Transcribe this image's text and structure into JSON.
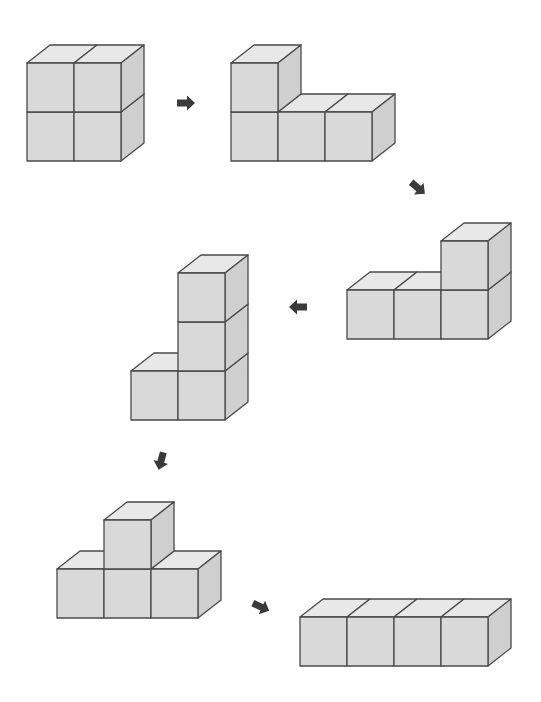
{
  "diagram": {
    "title": "Cube block transformation sequence",
    "cube": {
      "w": 47,
      "h": 49,
      "dx": 23,
      "dy": -18
    },
    "colors": {
      "background": "#ffffff",
      "front": "#d9d9d9",
      "top": "#e8e8e8",
      "side": "#cfcfcf",
      "stroke": "#4a4a4a",
      "arrow": "#3a3a3a"
    },
    "shapes": [
      {
        "id": "shape-1",
        "label": "2x2 square of four cubes",
        "origin": [
          27,
          161
        ],
        "cells": [
          [
            0,
            0
          ],
          [
            1,
            0
          ],
          [
            0,
            1
          ],
          [
            1,
            1
          ]
        ]
      },
      {
        "id": "shape-2",
        "label": "L shape: three cubes in a row, one on top-left",
        "origin": [
          231,
          161
        ],
        "cells": [
          [
            0,
            0
          ],
          [
            1,
            0
          ],
          [
            2,
            0
          ],
          [
            0,
            1
          ]
        ]
      },
      {
        "id": "shape-3",
        "label": "L shape: three cubes in a row, one on top-right",
        "origin": [
          347,
          339
        ],
        "cells": [
          [
            0,
            0
          ],
          [
            1,
            0
          ],
          [
            2,
            0
          ],
          [
            2,
            1
          ]
        ]
      },
      {
        "id": "shape-4",
        "label": "Tower of three cubes with one cube at bottom-left",
        "origin": [
          131,
          420
        ],
        "cells": [
          [
            0,
            0
          ],
          [
            1,
            0
          ],
          [
            1,
            1
          ],
          [
            1,
            2
          ]
        ]
      },
      {
        "id": "shape-5",
        "label": "T shape: three cubes in a row, one on top-middle",
        "origin": [
          57,
          618
        ],
        "cells": [
          [
            0,
            0
          ],
          [
            1,
            0
          ],
          [
            2,
            0
          ],
          [
            1,
            1
          ]
        ]
      },
      {
        "id": "shape-6",
        "label": "Straight row of four cubes",
        "origin": [
          300,
          666
        ],
        "cells": [
          [
            0,
            0
          ],
          [
            1,
            0
          ],
          [
            2,
            0
          ],
          [
            3,
            0
          ]
        ]
      }
    ],
    "arrows": [
      {
        "id": "arrow-1",
        "direction": "right",
        "x": 186,
        "y": 103,
        "angle": 0
      },
      {
        "id": "arrow-2",
        "direction": "down-right",
        "x": 418,
        "y": 188,
        "angle": 40
      },
      {
        "id": "arrow-3",
        "direction": "left",
        "x": 298,
        "y": 307,
        "angle": 180
      },
      {
        "id": "arrow-4",
        "direction": "down-left",
        "x": 161,
        "y": 461,
        "angle": 105
      },
      {
        "id": "arrow-5",
        "direction": "down-right",
        "x": 261,
        "y": 607,
        "angle": 25
      }
    ]
  }
}
